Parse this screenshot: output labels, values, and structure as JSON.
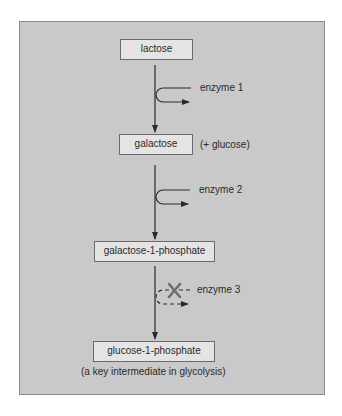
{
  "diagram": {
    "type": "metabolic-pathway",
    "nodes": [
      {
        "id": "lactose",
        "label": "lactose"
      },
      {
        "id": "galactose",
        "label": "galactose",
        "note": "(+ glucose)"
      },
      {
        "id": "galactose-1-phosphate",
        "label": "galactose-1-phosphate"
      },
      {
        "id": "glucose-1-phosphate",
        "label": "glucose-1-phosphate",
        "note": "(a key intermediate in glycolysis)"
      }
    ],
    "edges": [
      {
        "from": "lactose",
        "to": "galactose",
        "enzyme": "enzyme 1",
        "blocked": false
      },
      {
        "from": "galactose",
        "to": "galactose-1-phosphate",
        "enzyme": "enzyme 2",
        "blocked": false
      },
      {
        "from": "galactose-1-phosphate",
        "to": "glucose-1-phosphate",
        "enzyme": "enzyme 3",
        "blocked": true
      }
    ],
    "colors": {
      "panel_bg": "#c9c9c9",
      "box_bg": "#e4e4e4",
      "line": "#2a2a2a",
      "block_mark": "#6f6f6f"
    }
  }
}
